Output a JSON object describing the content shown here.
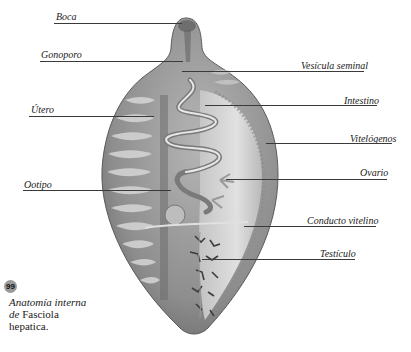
{
  "figure": {
    "number": "99",
    "caption": {
      "line1": "Anatomía interna",
      "line2_italic": "de",
      "line2_normal": " Fasciola",
      "line3": "hepatica."
    },
    "labels": {
      "boca": "Boca",
      "gonoporo": "Gonoporo",
      "utero": "Útero",
      "ootipo": "Ootipo",
      "vesicula_seminal": "Vesícula seminal",
      "intestino": "Intestino",
      "vitelogenos": "Vitelógenos",
      "ovario": "Ovario",
      "conducto_vitelino": "Conducto vitelino",
      "testiculo": "Testículo"
    },
    "colors": {
      "body": "#8c8c8c",
      "body_dark": "#6e6e6e",
      "body_light": "#d8d8d8",
      "leader": "#3a3a3a",
      "badge": "#9a9a9a"
    }
  }
}
